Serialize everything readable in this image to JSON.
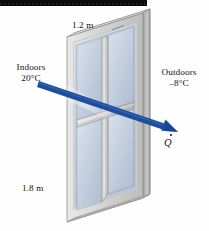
{
  "figure": {
    "background_color": "#fefefe"
  },
  "labels": {
    "top_dimension": "1.2 m",
    "bottom_dimension": "1.8 m",
    "indoors_name": "Indoors",
    "indoors_temperature": "20°C",
    "outdoors_name": "Outdoors",
    "outdoors_temperature": "–8°C",
    "heat_rate_symbol": "Q"
  },
  "colors": {
    "arrow": "#1d4f9e",
    "arrow_dark": "#173f80",
    "glass": "#c4cfde",
    "glass_light": "#dde4ee",
    "frame_face": "#d7d8d6",
    "frame_edge": "#a9aaa8",
    "frame_top": "#ececea",
    "frame_side_dark": "#8e8f8d",
    "muntin": "#b8b9b7",
    "text": "#141414",
    "scanbar": "#0d0d0d"
  },
  "geometry": {
    "window_corners": {
      "top_left": [
        67,
        37
      ],
      "top_right": [
        143,
        13
      ],
      "bottom_right": [
        143,
        198
      ],
      "bottom_left": [
        67,
        222
      ]
    },
    "panes": 4,
    "mullion": "vertical center",
    "muntin": "horizontal center"
  },
  "arrow": {
    "start": [
      38,
      84
    ],
    "end": [
      178,
      132
    ],
    "label": "Q",
    "has_dot_accent": true,
    "direction": "indoors to outdoors"
  },
  "scanbar": {
    "present": true,
    "width": 147,
    "height": 6
  }
}
